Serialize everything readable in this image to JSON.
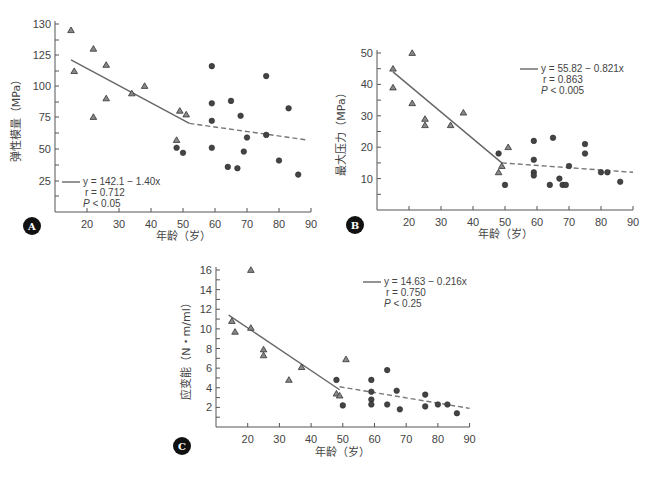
{
  "caption": "",
  "chart_data": [
    {
      "id": "A",
      "type": "scatter",
      "panel_label": "A",
      "title": "",
      "xlabel": "年龄（岁）",
      "ylabel": "弹性模量（MPa）",
      "x_ticks": [
        20,
        30,
        40,
        50,
        60,
        70,
        80,
        90
      ],
      "y_tick_labels": [
        "25",
        "50",
        "75",
        "100",
        "125",
        "130"
      ],
      "xlim": [
        10,
        90
      ],
      "legend": {
        "equation": "y = 142.1 − 1.40x",
        "r": "r = 0.712",
        "p": "P < 0.05",
        "position": "lower-left"
      },
      "fit_solid": [
        [
          15,
          121
        ],
        [
          52,
          70
        ]
      ],
      "fit_dashed": [
        [
          52,
          70
        ],
        [
          89,
          57
        ]
      ],
      "series": [
        {
          "name": "triangle",
          "marker": "triangle",
          "points": [
            [
              15,
              129
            ],
            [
              16,
              112
            ],
            [
              22,
              126
            ],
            [
              22,
              75
            ],
            [
              26,
              117
            ],
            [
              26,
              90
            ],
            [
              34,
              94
            ],
            [
              38,
              100
            ],
            [
              49,
              80
            ],
            [
              48,
              57
            ],
            [
              51,
              77
            ]
          ]
        },
        {
          "name": "circle",
          "marker": "circle",
          "points": [
            [
              48,
              51
            ],
            [
              50,
              47
            ],
            [
              59,
              116
            ],
            [
              59,
              86
            ],
            [
              59,
              72
            ],
            [
              59,
              51
            ],
            [
              64,
              36
            ],
            [
              65,
              88
            ],
            [
              67,
              35
            ],
            [
              68,
              76
            ],
            [
              69,
              48
            ],
            [
              70,
              59
            ],
            [
              76,
              108
            ],
            [
              76,
              61
            ],
            [
              80,
              41
            ],
            [
              83,
              82
            ],
            [
              86,
              30
            ]
          ]
        }
      ]
    },
    {
      "id": "B",
      "type": "scatter",
      "panel_label": "B",
      "title": "",
      "xlabel": "年龄（岁）",
      "ylabel": "最大压力（MPa）",
      "x_ticks": [
        20,
        30,
        40,
        50,
        60,
        70,
        80,
        90
      ],
      "y_ticks": [
        10,
        20,
        30,
        40,
        50
      ],
      "xlim": [
        10,
        90
      ],
      "ylim": [
        0,
        50
      ],
      "legend": {
        "equation": "y = 55.82 − 0.821x",
        "r": "r = 0.863",
        "p": "P < 0.005",
        "position": "upper-right"
      },
      "fit_solid": [
        [
          15,
          44
        ],
        [
          49,
          15
        ]
      ],
      "fit_dashed": [
        [
          49,
          15
        ],
        [
          90,
          12
        ]
      ],
      "series": [
        {
          "name": "triangle",
          "marker": "triangle",
          "points": [
            [
              15,
              45
            ],
            [
              15,
              39
            ],
            [
              21,
              50
            ],
            [
              21,
              34
            ],
            [
              25,
              29
            ],
            [
              25,
              27
            ],
            [
              33,
              27
            ],
            [
              37,
              31
            ],
            [
              48,
              12
            ],
            [
              49,
              14
            ],
            [
              51,
              20
            ]
          ]
        },
        {
          "name": "circle",
          "marker": "circle",
          "points": [
            [
              48,
              18
            ],
            [
              50,
              8
            ],
            [
              59,
              22
            ],
            [
              59,
              16
            ],
            [
              59,
              12
            ],
            [
              59,
              11
            ],
            [
              64,
              8
            ],
            [
              65,
              23
            ],
            [
              67,
              10
            ],
            [
              68,
              8
            ],
            [
              69,
              8
            ],
            [
              70,
              14
            ],
            [
              75,
              21
            ],
            [
              75,
              18
            ],
            [
              80,
              12
            ],
            [
              82,
              12
            ],
            [
              86,
              9
            ]
          ]
        }
      ]
    },
    {
      "id": "C",
      "type": "scatter",
      "panel_label": "C",
      "title": "",
      "xlabel": "年龄（岁）",
      "ylabel": "应变能（N・m/ml）",
      "x_ticks": [
        20,
        30,
        40,
        50,
        60,
        70,
        80,
        90
      ],
      "y_ticks": [
        2,
        4,
        6,
        8,
        10,
        12,
        14,
        16
      ],
      "xlim": [
        10,
        90
      ],
      "ylim": [
        0,
        16
      ],
      "legend": {
        "equation": "y = 14.63 − 0.216x",
        "r": "r = 0.750",
        "p": "P < 0.25",
        "position": "upper-right"
      },
      "fit_solid": [
        [
          14,
          11.4
        ],
        [
          49,
          3.8
        ]
      ],
      "fit_dashed": [
        [
          49,
          4.1
        ],
        [
          90,
          1.9
        ]
      ],
      "series": [
        {
          "name": "triangle",
          "marker": "triangle",
          "points": [
            [
              15,
              10.8
            ],
            [
              16,
              9.7
            ],
            [
              21,
              16
            ],
            [
              21,
              10.1
            ],
            [
              25,
              7.9
            ],
            [
              25,
              7.3
            ],
            [
              33,
              4.8
            ],
            [
              37,
              6.1
            ],
            [
              48,
              3.4
            ],
            [
              49,
              3.2
            ],
            [
              51,
              6.9
            ]
          ]
        },
        {
          "name": "circle",
          "marker": "circle",
          "points": [
            [
              48,
              4.8
            ],
            [
              50,
              2.2
            ],
            [
              59,
              4.8
            ],
            [
              59,
              3.6
            ],
            [
              59,
              2.8
            ],
            [
              59,
              2.3
            ],
            [
              64,
              5.8
            ],
            [
              64,
              2.3
            ],
            [
              67,
              3.7
            ],
            [
              68,
              1.8
            ],
            [
              76,
              3.3
            ],
            [
              76,
              2.1
            ],
            [
              80,
              2.3
            ],
            [
              83,
              2.3
            ],
            [
              86,
              1.4
            ]
          ]
        }
      ]
    }
  ]
}
